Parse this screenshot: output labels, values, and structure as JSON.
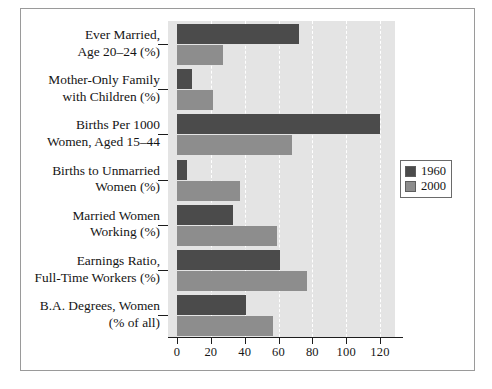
{
  "chart_data": {
    "type": "bar",
    "orientation": "horizontal",
    "title": "",
    "xlabel": "",
    "ylabel": "",
    "xlim": [
      0,
      128
    ],
    "xticks": [
      0,
      20,
      40,
      60,
      80,
      100,
      120
    ],
    "xtick_labels": [
      "0",
      "20",
      "40",
      "60",
      "80",
      "100",
      "120"
    ],
    "grid": true,
    "grid_style": "white dashed vertical",
    "legend_position": "right-middle",
    "categories": [
      "Ever Married, Age 20–24 (%)",
      "Mother-Only Family with Children (%)",
      "Births Per 1000 Women, Aged 15–44",
      "Births to Unmarried Women (%)",
      "Married Women Working (%)",
      "Earnings Ratio, Full-Time Workers (%)",
      "B.A. Degrees, Women (% of all)"
    ],
    "category_lines": [
      [
        "Ever Married,",
        "Age 20–24 (%)"
      ],
      [
        "Mother-Only Family",
        "with Children (%)"
      ],
      [
        "Births Per 1000",
        "Women, Aged 15–44"
      ],
      [
        "Births to Unmarried",
        "Women (%)"
      ],
      [
        "Married Women",
        "Working (%)"
      ],
      [
        "Earnings Ratio,",
        "Full-Time Workers (%)"
      ],
      [
        "B.A. Degrees, Women",
        "(% of all)"
      ]
    ],
    "series": [
      {
        "name": "1960",
        "color": "#4b4b4b",
        "values": [
          72,
          9,
          120,
          6,
          33,
          61,
          41
        ]
      },
      {
        "name": "2000",
        "color": "#8d8d8d",
        "values": [
          27,
          21,
          68,
          37,
          59,
          77,
          57
        ]
      }
    ]
  },
  "legend": {
    "entries": [
      {
        "label": "1960",
        "color": "#4b4b4b"
      },
      {
        "label": "2000",
        "color": "#8d8d8d"
      }
    ]
  },
  "style": {
    "plot_background": "#e4e4e4",
    "frame_color": "#9a9a9a",
    "axis_color": "#1d1d1d",
    "text_color": "#141414"
  }
}
